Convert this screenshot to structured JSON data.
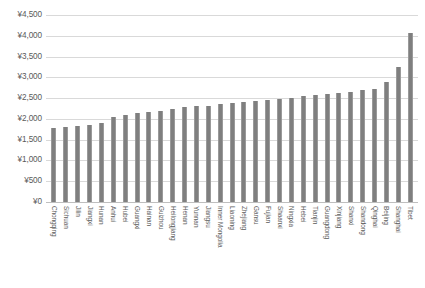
{
  "chart_data": {
    "type": "bar",
    "title": "",
    "subtitle": "",
    "xlabel": "",
    "ylabel": "",
    "ylim": [
      0,
      4500
    ],
    "y_tick_step": 500,
    "currency_prefix": "¥",
    "grid": true,
    "legend": false,
    "bar_color": "#7f7f7f",
    "gridline_color": "#d9d9d9",
    "y_ticks": [
      "¥0",
      "¥500",
      "¥1,000",
      "¥1,500",
      "¥2,000",
      "¥2,500",
      "¥3,000",
      "¥3,500",
      "¥4,000",
      "¥4,500"
    ],
    "y_tick_values": [
      0,
      500,
      1000,
      1500,
      2000,
      2500,
      3000,
      3500,
      4000,
      4500
    ],
    "categories": [
      "Chongqing",
      "Sichuan",
      "Jilin",
      "Jiangxi",
      "Hunan",
      "Anhui",
      "Hubei",
      "Guangxi",
      "Hainan",
      "Guizhou",
      "Heilongjiang",
      "Henan",
      "Yunnan",
      "Jiangsu",
      "Inner Mongolia",
      "Liaoning",
      "Zhejiang",
      "Gansu",
      "Fujian",
      "Shaanxi",
      "Ningxia",
      "Hebei",
      "Tianjin",
      "Guangdong",
      "Xinjiang",
      "Shanxi",
      "Shandong",
      "Qinghai",
      "Beijing",
      "Shanghai",
      "Tibet"
    ],
    "values": [
      1790,
      1800,
      1820,
      1860,
      1890,
      2040,
      2090,
      2150,
      2170,
      2200,
      2250,
      2280,
      2300,
      2320,
      2350,
      2380,
      2400,
      2420,
      2450,
      2470,
      2500,
      2560,
      2580,
      2600,
      2620,
      2650,
      2700,
      2730,
      2900,
      3250,
      4060
    ]
  }
}
